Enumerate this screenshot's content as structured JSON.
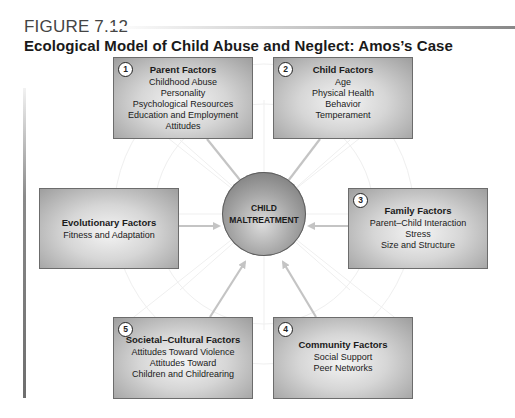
{
  "figure": {
    "label": "FIGURE 7.12",
    "title": "Ecological Model of Child Abuse and Neglect: Amos’s Case"
  },
  "center": {
    "line1": "CHILD",
    "line2": "MALTREATMENT"
  },
  "factors": {
    "parent": {
      "number": "1",
      "heading": "Parent Factors",
      "items": [
        "Childhood Abuse",
        "Personality",
        "Psychological Resources",
        "Education and Employment",
        "Attitudes"
      ]
    },
    "child": {
      "number": "2",
      "heading": "Child Factors",
      "items": [
        "Age",
        "Physical Health",
        "Behavior",
        "Temperament"
      ]
    },
    "family": {
      "number": "3",
      "heading": "Family Factors",
      "items": [
        "Parent–Child Interaction",
        "Stress",
        "Size and Structure"
      ]
    },
    "community": {
      "number": "4",
      "heading": "Community Factors",
      "items": [
        "Social Support",
        "Peer Networks"
      ]
    },
    "societal": {
      "number": "5",
      "heading": "Societal–Cultural Factors",
      "items": [
        "Attitudes Toward Violence",
        "Attitudes Toward",
        "Children and Childrearing"
      ]
    },
    "evolutionary": {
      "heading": "Evolutionary Factors",
      "items": [
        "Fitness and Adaptation"
      ]
    }
  },
  "colors": {
    "box_fill_center": "#f4f4f4",
    "box_fill_edge": "#9e9e9e",
    "arrow": "#c4c4c4",
    "background_pattern": "#ececec"
  }
}
